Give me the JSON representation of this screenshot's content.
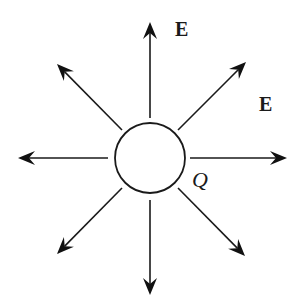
{
  "diagram": {
    "charge": {
      "label": "Q",
      "cx": 150,
      "cy": 158,
      "r": 35
    },
    "field_labels": [
      {
        "text": "E",
        "x": 175,
        "y": 36
      },
      {
        "text": "E",
        "x": 259,
        "y": 111
      }
    ],
    "arrows": [
      {
        "name": "arrow-up",
        "x1": 150,
        "y1": 118,
        "x2": 150,
        "y2": 22
      },
      {
        "name": "arrow-down",
        "x1": 150,
        "y1": 200,
        "x2": 150,
        "y2": 295
      },
      {
        "name": "arrow-left",
        "x1": 108,
        "y1": 158,
        "x2": 18,
        "y2": 158
      },
      {
        "name": "arrow-right",
        "x1": 190,
        "y1": 158,
        "x2": 287,
        "y2": 158
      },
      {
        "name": "arrow-up-left",
        "x1": 122,
        "y1": 130,
        "x2": 57,
        "y2": 64
      },
      {
        "name": "arrow-up-right",
        "x1": 178,
        "y1": 130,
        "x2": 246,
        "y2": 62
      },
      {
        "name": "arrow-down-left",
        "x1": 122,
        "y1": 188,
        "x2": 57,
        "y2": 254
      },
      {
        "name": "arrow-down-right",
        "x1": 178,
        "y1": 188,
        "x2": 245,
        "y2": 256
      }
    ],
    "colors": {
      "stroke": "#1a1a1a",
      "background": "#ffffff"
    }
  }
}
